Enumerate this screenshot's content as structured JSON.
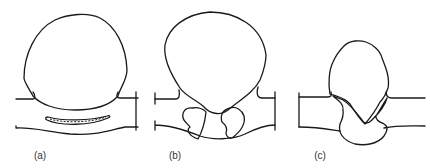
{
  "figure": {
    "panels": [
      {
        "id": "a",
        "label": "(a)",
        "label_x": 40,
        "description": "Large rounded bead above plate with a thin elongated inclusion inside the plate"
      },
      {
        "id": "b",
        "label": "(b)",
        "label_x": 175,
        "description": "Rounded bead with narrow neck and two stippled regions at root"
      },
      {
        "id": "c",
        "label": "(c)",
        "label_x": 320,
        "description": "Irregular bead with hatched V-shaped root fusion region"
      }
    ],
    "colors": {
      "line": "#1a1a1a",
      "background": "#ffffff",
      "label": "#333333"
    }
  }
}
